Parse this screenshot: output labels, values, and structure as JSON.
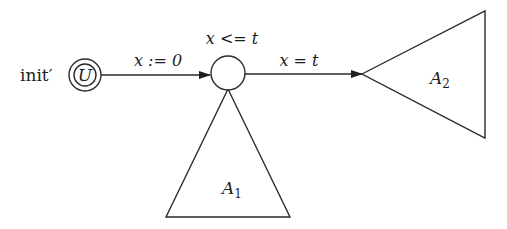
{
  "diagram": {
    "type": "automaton",
    "init_label": "init′",
    "nodes": {
      "initial": {
        "label": "U",
        "style": "double-circle"
      },
      "middle": {
        "label": "",
        "invariant": "x <= t"
      }
    },
    "edges": {
      "init_to_middle": {
        "label": "x := 0"
      },
      "middle_to_a2": {
        "label": "x = t"
      }
    },
    "subautomata": {
      "a1": {
        "name": "A",
        "sub": "1"
      },
      "a2": {
        "name": "A",
        "sub": "2"
      }
    },
    "colors": {
      "line": "#2a2a2a",
      "text": "#1e1e1e",
      "background": "#ffffff"
    }
  }
}
